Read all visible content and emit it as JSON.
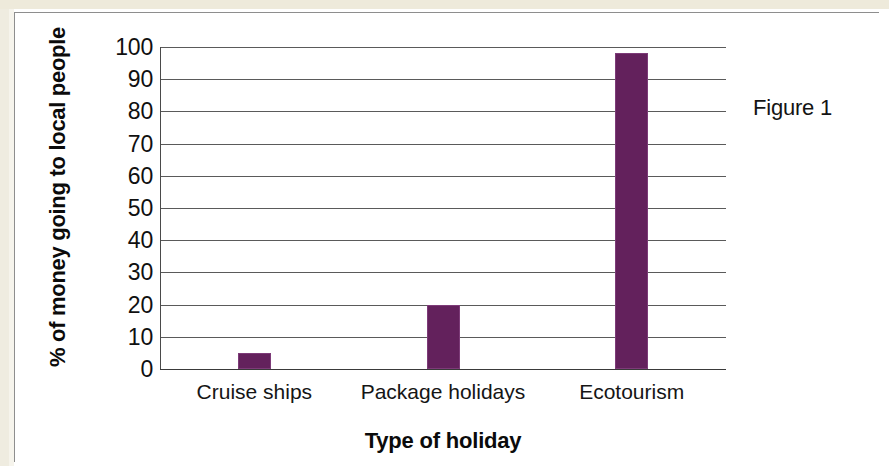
{
  "figure": {
    "caption": "Figure 1"
  },
  "chart_data": {
    "type": "bar",
    "title": "",
    "categories": [
      "Cruise ships",
      "Package holidays",
      "Ecotourism"
    ],
    "values": [
      5,
      20,
      98
    ],
    "series": [
      {
        "name": "% of money going to local people",
        "values": [
          5,
          20,
          98
        ]
      }
    ],
    "xlabel": "Type of holiday",
    "ylabel": "% of money going to local people",
    "ylim": [
      0,
      100
    ],
    "yticks": [
      0,
      10,
      20,
      30,
      40,
      50,
      60,
      70,
      80,
      90,
      100
    ],
    "ytick_labels": [
      "0",
      "10",
      "20",
      "30",
      "40",
      "50",
      "60",
      "70",
      "80",
      "90",
      "100"
    ],
    "grid": true,
    "grid_axis": "y",
    "legend": false,
    "legend_position": "none",
    "bar_color": "#63215c",
    "bar_edge_color": "#7d3b78",
    "background_color": "#ffffff",
    "annotations": [
      "Figure 1"
    ]
  }
}
